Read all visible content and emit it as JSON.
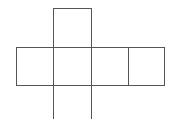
{
  "diagram": {
    "type": "cube-net",
    "stroke_color": "#555555",
    "background": "#ffffff",
    "cells": [
      {
        "name": "top-face",
        "x": 53,
        "y": 8,
        "w": 38,
        "h": 39
      },
      {
        "name": "left-face",
        "x": 16,
        "y": 47,
        "w": 37,
        "h": 38
      },
      {
        "name": "center-face",
        "x": 53,
        "y": 47,
        "w": 38,
        "h": 38
      },
      {
        "name": "right-face",
        "x": 91,
        "y": 47,
        "w": 37,
        "h": 38
      },
      {
        "name": "far-right-face",
        "x": 128,
        "y": 47,
        "w": 36,
        "h": 38
      },
      {
        "name": "bottom-face",
        "x": 53,
        "y": 85,
        "w": 38,
        "h": 40
      }
    ]
  }
}
